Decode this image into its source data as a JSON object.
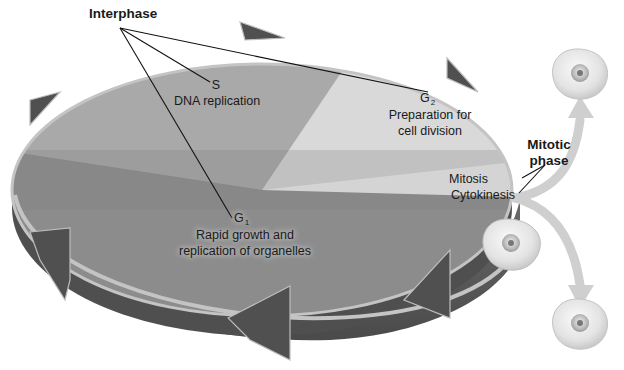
{
  "diagram": {
    "interphase": {
      "label": "Interphase",
      "phases": [
        {
          "id": "S",
          "name": "S",
          "subscript": "",
          "description_lines": [
            "DNA replication"
          ]
        },
        {
          "id": "G2",
          "name": "G",
          "subscript": "2",
          "description_lines": [
            "Preparation for",
            "cell division"
          ]
        },
        {
          "id": "G1",
          "name": "G",
          "subscript": "1",
          "description_lines": [
            "Rapid growth and",
            "replication of organelles"
          ]
        }
      ]
    },
    "mitotic_phase": {
      "label_lines": [
        "Mitotic",
        "phase"
      ],
      "stages": [
        "Mitosis",
        "Cytokinesis"
      ]
    },
    "cells": [
      {
        "id": "parent-cell",
        "role": "dividing cell"
      },
      {
        "id": "daughter-cell-top",
        "role": "daughter cell"
      },
      {
        "id": "daughter-cell-bottom",
        "role": "daughter cell"
      }
    ],
    "colors": {
      "g1_sector": "#8c8c8c",
      "s_sector": "#a9a9a9",
      "g2_sector": "#d9d9d9",
      "mitotic_sector": "#f2f2f2",
      "ring": "#5a5a5a",
      "rim_highlight": "#c4c4c4",
      "division_arrow": "#cfcfcf",
      "cell_body": "#e6e6e6",
      "leader_line": "#111111"
    }
  }
}
